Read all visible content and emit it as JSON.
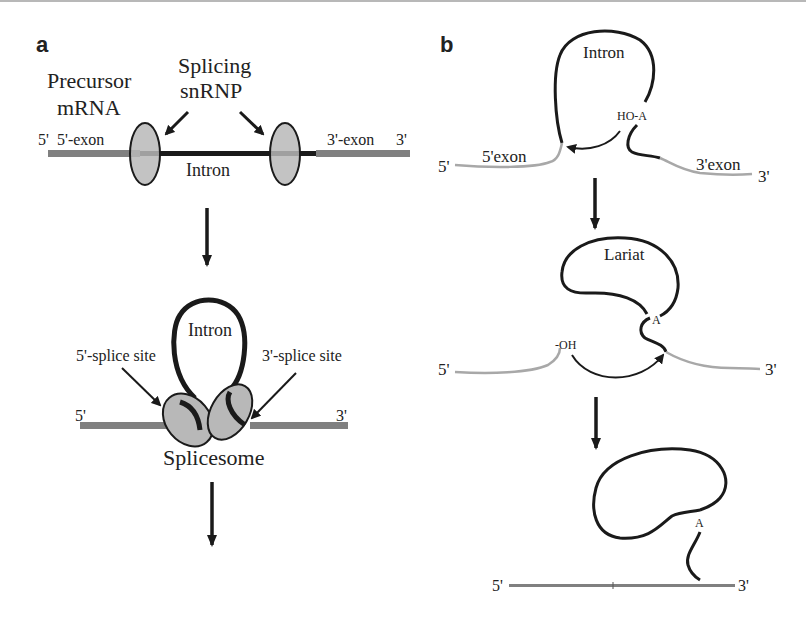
{
  "panel_a": {
    "label": "a",
    "step1": {
      "precursor_line1": "Precursor",
      "precursor_line2": "mRNA",
      "snrnp_line1": "Splicing",
      "snrnp_line2": "snRNP",
      "five_prime": "5'",
      "five_exon": "5'-exon",
      "three_exon": "3'-exon",
      "three_prime": "3'",
      "intron": "Intron"
    },
    "step2": {
      "intron": "Intron",
      "five_splice_site": "5'-splice site",
      "three_splice_site": "3'-splice site",
      "five_prime": "5'",
      "three_prime": "3'",
      "splicesome": "Splicesome"
    }
  },
  "panel_b": {
    "label": "b",
    "step1": {
      "intron": "Intron",
      "hoa": "HO-A",
      "five_prime": "5'",
      "five_exon": "5'exon",
      "three_exon": "3'exon",
      "three_prime": "3'"
    },
    "step2": {
      "lariat": "Lariat",
      "a": "A",
      "oh": "-OH",
      "five_prime": "5'",
      "three_prime": "3'"
    },
    "step3": {
      "a": "A",
      "five_prime": "5'",
      "three_prime": "3'"
    }
  },
  "colors": {
    "exon": "#808080",
    "intron": "#1a1a1a",
    "snrnp_fill": "#b8b8b8",
    "light_exon": "#a8a8a8"
  }
}
